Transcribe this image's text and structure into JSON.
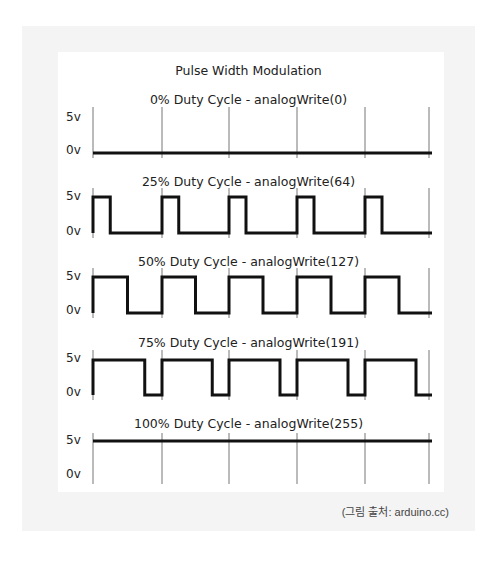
{
  "chart_data": {
    "type": "line",
    "title": "Pulse Width Modulation",
    "xlabel": "",
    "ylabel": "",
    "y_tick_labels": [
      "5v",
      "0v"
    ],
    "grid": "vertical period markers",
    "periods_shown": 5,
    "series": [
      {
        "name": "0% Duty Cycle - analogWrite(0)",
        "duty_cycle": 0,
        "analogWrite": 0,
        "level_pattern": "always 0v"
      },
      {
        "name": "25% Duty Cycle - analogWrite(64)",
        "duty_cycle": 25,
        "analogWrite": 64,
        "level_pattern": "5v for 25% of each period, then 0v"
      },
      {
        "name": "50% Duty Cycle - analogWrite(127)",
        "duty_cycle": 50,
        "analogWrite": 127,
        "level_pattern": "5v for 50% of each period, then 0v"
      },
      {
        "name": "75% Duty Cycle - analogWrite(191)",
        "duty_cycle": 75,
        "analogWrite": 191,
        "level_pattern": "5v for 75% of each period, then 0v"
      },
      {
        "name": "100% Duty Cycle - analogWrite(255)",
        "duty_cycle": 100,
        "analogWrite": 255,
        "level_pattern": "always 5v"
      }
    ]
  },
  "figure": {
    "title": "Pulse Width Modulation",
    "rows": [
      {
        "label": "0% Duty Cycle - analogWrite(0)",
        "high": "5v",
        "low": "0v",
        "duty": 0
      },
      {
        "label": "25% Duty Cycle - analogWrite(64)",
        "high": "5v",
        "low": "0v",
        "duty": 0.25
      },
      {
        "label": "50% Duty Cycle - analogWrite(127)",
        "high": "5v",
        "low": "0v",
        "duty": 0.5
      },
      {
        "label": "75% Duty Cycle - analogWrite(191)",
        "high": "5v",
        "low": "0v",
        "duty": 0.75
      },
      {
        "label": "100% Duty Cycle - analogWrite(255)",
        "high": "5v",
        "low": "0v",
        "duty": 1
      }
    ],
    "caption": "(그림 출처: arduino.cc)"
  },
  "colors": {
    "wave": "#111111",
    "tick": "#777777",
    "backdrop": "#f4f4f4"
  }
}
